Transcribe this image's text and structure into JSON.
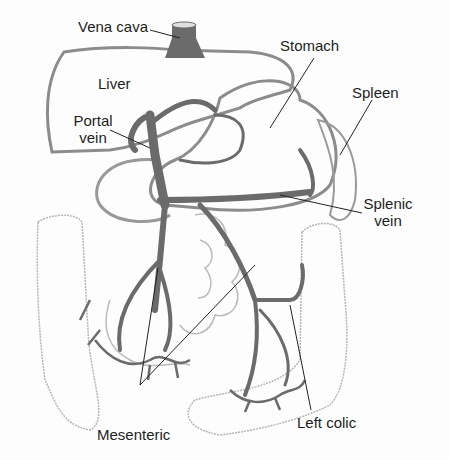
{
  "diagram": {
    "type": "anatomy",
    "colors": {
      "vein": "#6b6b6b",
      "organ_outline": "#8c8c8c",
      "intestine_outline": "#b5b5b5",
      "leader": "#222222",
      "text": "#1e1e1e",
      "background": "#fdfdfd"
    },
    "labels": {
      "vena_cava": "Vena cava",
      "stomach": "Stomach",
      "liver": "Liver",
      "spleen": "Spleen",
      "portal_vein_1": "Portal",
      "portal_vein_2": "vein",
      "splenic_vein_1": "Splenic",
      "splenic_vein_2": "vein",
      "mesenteric": "Mesenteric",
      "left_colic": "Left colic"
    }
  }
}
